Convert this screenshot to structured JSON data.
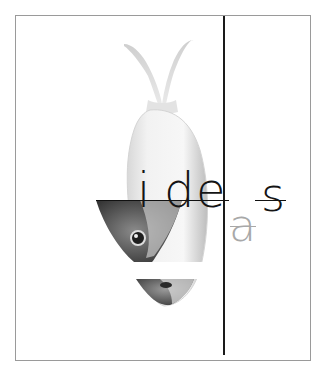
{
  "artwork": {
    "title_letters": [
      {
        "char": "i",
        "tone": "dark"
      },
      {
        "char": "d",
        "tone": "dark"
      },
      {
        "char": "e",
        "tone": "dark"
      },
      {
        "char": "a",
        "tone": "gray"
      },
      {
        "char": "s",
        "tone": "dark"
      }
    ],
    "word": "ideas",
    "colors": {
      "frame": "#9a9a9a",
      "rule": "#1a1a1a",
      "letter_dark": "#141414",
      "letter_gray": "#a8a8a8",
      "background": "#ffffff"
    },
    "subject": "fish-illustration"
  }
}
